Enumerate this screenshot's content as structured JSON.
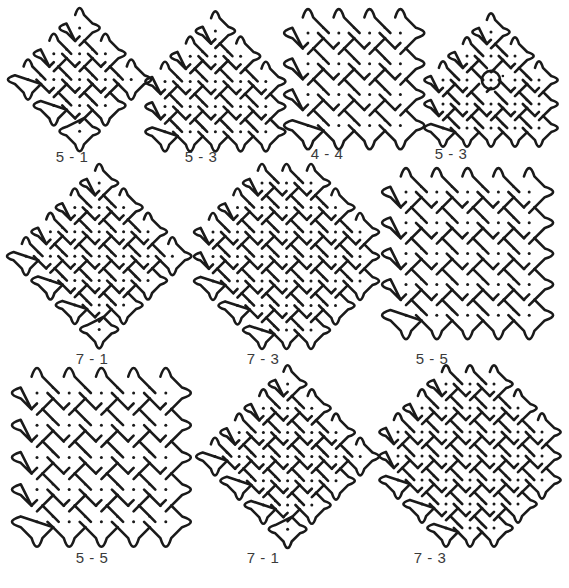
{
  "figure": {
    "stroke_color": "#1a1a1a",
    "dot_color": "#1a1a1a",
    "kolams": [
      {
        "id": "kolam-1",
        "label": "5 - 1",
        "rows": [
          [
            2
          ],
          [
            1,
            2,
            3
          ],
          [
            0,
            1,
            2,
            3,
            4
          ],
          [
            1,
            2,
            3
          ],
          [
            2
          ]
        ],
        "circles": []
      },
      {
        "id": "kolam-2",
        "label": "5 - 3",
        "rows": [
          [
            2
          ],
          [
            1,
            2,
            3
          ],
          [
            0,
            1,
            2,
            3,
            4
          ],
          [
            0,
            1,
            2,
            3,
            4
          ],
          [
            0,
            1,
            2,
            3,
            4
          ]
        ],
        "circles": []
      },
      {
        "id": "kolam-3",
        "label": "4 - 4",
        "rows": [
          [
            0,
            1,
            2,
            3
          ],
          [
            0,
            1,
            2,
            3
          ],
          [
            0,
            1,
            2,
            3
          ],
          [
            0,
            1,
            2,
            3
          ]
        ],
        "circles": []
      },
      {
        "id": "kolam-4",
        "label": "5 - 3",
        "rows": [
          [
            2
          ],
          [
            1,
            2,
            3
          ],
          [
            0,
            1,
            2,
            3,
            4
          ],
          [
            0,
            1,
            2,
            3,
            4
          ],
          [
            0,
            1,
            2,
            3,
            4
          ]
        ],
        "circles": [
          [
            2,
            2
          ]
        ]
      },
      {
        "id": "kolam-5",
        "label": "7 - 1",
        "rows": [
          [
            3
          ],
          [
            2,
            3,
            4
          ],
          [
            1,
            2,
            3,
            4,
            5
          ],
          [
            0,
            1,
            2,
            3,
            4,
            5,
            6
          ],
          [
            1,
            2,
            3,
            4,
            5
          ],
          [
            2,
            3,
            4
          ],
          [
            3
          ]
        ],
        "circles": []
      },
      {
        "id": "kolam-6",
        "label": "7 - 3",
        "rows": [
          [
            2,
            3,
            4
          ],
          [
            1,
            2,
            3,
            4,
            5
          ],
          [
            0,
            1,
            2,
            3,
            4,
            5,
            6
          ],
          [
            0,
            1,
            2,
            3,
            4,
            5,
            6
          ],
          [
            0,
            1,
            2,
            3,
            4,
            5,
            6
          ],
          [
            1,
            2,
            3,
            4,
            5
          ],
          [
            2,
            3,
            4
          ]
        ],
        "circles": []
      },
      {
        "id": "kolam-7",
        "label": "5 - 5",
        "rows": [
          [
            0,
            1,
            2,
            3,
            4
          ],
          [
            0,
            1,
            2,
            3,
            4
          ],
          [
            0,
            1,
            2,
            3,
            4
          ],
          [
            0,
            1,
            2,
            3,
            4
          ],
          [
            0,
            1,
            2,
            3,
            4
          ]
        ],
        "circles": []
      },
      {
        "id": "kolam-8",
        "label": "5 - 5",
        "rows": [
          [
            0,
            1,
            2,
            3,
            4
          ],
          [
            0,
            1,
            2,
            3,
            4
          ],
          [
            0,
            1,
            2,
            3,
            4
          ],
          [
            0,
            1,
            2,
            3,
            4
          ],
          [
            0,
            1,
            2,
            3,
            4
          ]
        ],
        "circles": []
      },
      {
        "id": "kolam-9",
        "label": "7 - 1",
        "rows": [
          [
            3
          ],
          [
            2,
            3,
            4
          ],
          [
            1,
            2,
            3,
            4,
            5
          ],
          [
            0,
            1,
            2,
            3,
            4,
            5,
            6
          ],
          [
            1,
            2,
            3,
            4,
            5
          ],
          [
            2,
            3,
            4
          ],
          [
            3
          ]
        ],
        "circles": []
      },
      {
        "id": "kolam-10",
        "label": "7 - 3",
        "rows": [
          [
            2,
            3,
            4
          ],
          [
            1,
            2,
            3,
            4,
            5
          ],
          [
            0,
            1,
            2,
            3,
            4,
            5,
            6
          ],
          [
            0,
            1,
            2,
            3,
            4,
            5,
            6
          ],
          [
            0,
            1,
            2,
            3,
            4,
            5,
            6
          ],
          [
            1,
            2,
            3,
            4,
            5
          ],
          [
            2,
            3,
            4
          ]
        ],
        "circles": []
      }
    ]
  }
}
